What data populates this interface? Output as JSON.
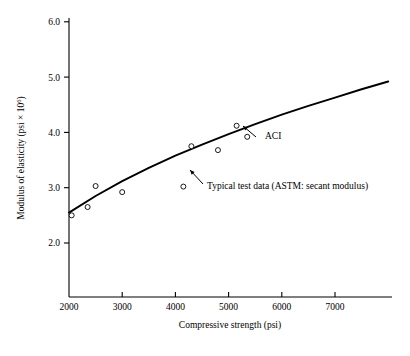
{
  "chart_data": {
    "type": "scatter",
    "title": "",
    "xlabel": "Compressive strength (psi)",
    "ylabel": "Modulus of elasticity (psi × 10⁶)",
    "ylabel_main": "Modulus of elasticity (psi × 10",
    "ylabel_exp": "6",
    "ylabel_tail": ")",
    "xlim": [
      2000,
      8000
    ],
    "ylim": [
      1.8,
      6.2
    ],
    "xticks": [
      2000,
      3000,
      4000,
      5000,
      6000,
      7000
    ],
    "xtick_labels": [
      "2000",
      "3000",
      "4000",
      "5000",
      "6000",
      "7000"
    ],
    "yticks": [
      2.0,
      3.0,
      4.0,
      5.0,
      6.0
    ],
    "ytick_labels": [
      "2.0",
      "3.0",
      "4.0",
      "5.0",
      "6.0"
    ],
    "grid": false,
    "legend": "none",
    "series": [
      {
        "name": "ACI",
        "type": "line",
        "label": "ACI",
        "marker": "none",
        "x": [
          2000,
          2500,
          3000,
          3500,
          4000,
          4500,
          5000,
          5500,
          6000,
          6500,
          7000,
          7500,
          8000
        ],
        "values": [
          2.55,
          2.85,
          3.12,
          3.36,
          3.58,
          3.78,
          3.97,
          4.15,
          4.32,
          4.48,
          4.63,
          4.78,
          4.92
        ]
      },
      {
        "name": "Typical test data (ASTM: secant modulus)",
        "type": "scatter",
        "label": "Typical test data (ASTM: secant modulus)",
        "marker": "open-circle",
        "x": [
          2050,
          2350,
          2500,
          3000,
          4150,
          4300,
          4800,
          5150,
          5350
        ],
        "values": [
          2.5,
          2.65,
          3.03,
          2.92,
          3.02,
          3.75,
          3.68,
          4.12,
          3.92
        ]
      }
    ],
    "annotations": [
      {
        "name": "aci-annotation",
        "text": "ACI",
        "text_x": 265,
        "text_y": 139,
        "arrow_from_x": 256,
        "arrow_from_y": 137,
        "arrow_to_x": 243,
        "arrow_to_y": 126
      },
      {
        "name": "typical-test-data-annotation",
        "text": "Typical test data (ASTM: secant modulus)",
        "text_x": 207,
        "text_y": 189,
        "arrow_from_x": 203,
        "arrow_from_y": 184,
        "arrow_to_x": 190,
        "arrow_to_y": 170
      }
    ]
  },
  "axes_geometry": {
    "x_origin_px": 69,
    "y_origin_px": 297,
    "x_end_px": 392,
    "y_top_px": 18,
    "px_per_1000_psi": 53.2,
    "px_per_unit_modulus": 55.3,
    "x_at_2000_px": 69,
    "y_at_2_0_px": 243,
    "y_at_6_0_px": 22
  }
}
